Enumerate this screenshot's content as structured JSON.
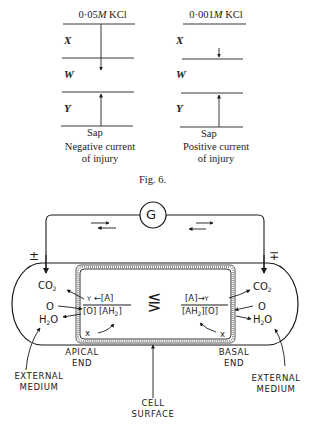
{
  "fig6": {
    "left_panel": {
      "header": "0·05M KCl",
      "header_num": "0·05",
      "header_unit": "M",
      "header_salt": "KCl",
      "layers": [
        "X",
        "W",
        "Y"
      ],
      "bottom": "Sap",
      "caption_line1": "Negative current",
      "caption_line2": "of injury"
    },
    "right_panel": {
      "header_num": "0·001",
      "header_unit": "M",
      "header_salt": "KCl",
      "layers": [
        "X",
        "W",
        "Y"
      ],
      "bottom": "Sap",
      "caption_line1": "Positive current",
      "caption_line2": "of injury"
    },
    "label": "Fig. 6."
  },
  "cell_diagram": {
    "galvanometer": "G",
    "left_polarity": "±",
    "right_polarity": "∓",
    "left": {
      "co2": "CO",
      "co2_sub": "2",
      "o": "O",
      "h2o_h": "H",
      "h2o_sub": "2",
      "h2o_o": "O",
      "numerator_y": "Y",
      "numerator_arrow": "←",
      "numerator_a": "[A]",
      "denominator_o": "[O]",
      "denominator_ah": "[AH",
      "denominator_sub": "2",
      "denominator_close": "]",
      "x": "x"
    },
    "right": {
      "co2": "CO",
      "co2_sub": "2",
      "o": "O",
      "h2o_h": "H",
      "h2o_sub": "2",
      "h2o_o": "O",
      "numerator_a": "[A]",
      "numerator_arrow": "→",
      "numerator_y": "Y",
      "denominator_ah": "[AH",
      "denominator_sub": "2",
      "denominator_close": "][O]",
      "x": "x"
    },
    "center_relation": "⋚",
    "labels": {
      "apical_end_1": "APICAL",
      "apical_end_2": "END",
      "basal_end_1": "BASAL",
      "basal_end_2": "END",
      "external_left_1": "EXTERNAL",
      "external_left_2": "MEDIUM",
      "external_right_1": "EXTERNAL",
      "external_right_2": "MEDIUM",
      "cell_surface_1": "CELL",
      "cell_surface_2": "SURFACE"
    }
  }
}
